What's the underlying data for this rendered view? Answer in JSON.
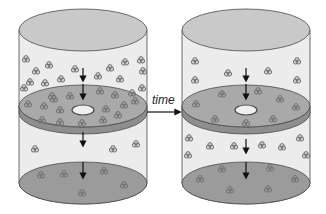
{
  "diagram": {
    "arrow_label": "time",
    "colors": {
      "cylinder_body": "#ececec",
      "top_cap": "#c9c9c9",
      "disc_top": "#a9a9a9",
      "disc_edge": "#8e8e8e",
      "bottom": "#9b9b9b",
      "outline": "#4a4a4a",
      "particle": "#7a7a7a"
    },
    "panels": [
      {
        "name": "before",
        "description": "cylinder with many particles above a porous disc, few below"
      },
      {
        "name": "after",
        "description": "cylinder with particles more evenly distributed above and below the disc"
      }
    ]
  }
}
